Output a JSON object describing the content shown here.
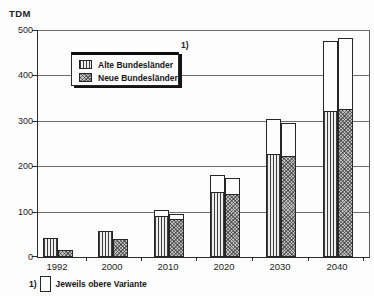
{
  "colors": {
    "ink": "#222222",
    "paper": "#fcfcfc",
    "crosshatch_gray": "#c2c2c2"
  },
  "legend": {
    "marker_note": "1)",
    "items": [
      {
        "label": "Alte Bundesländer",
        "pattern": "vertical-stripes"
      },
      {
        "label": "Neue Bundesländer",
        "pattern": "crosshatch"
      }
    ]
  },
  "footnote": {
    "marker": "1)",
    "text": "Jeweils obere Variante"
  },
  "chart_data": {
    "type": "bar",
    "title": "",
    "ylabel": "TDM",
    "xlabel": "",
    "ylim": [
      0,
      500
    ],
    "y_ticks": [
      0,
      100,
      200,
      300,
      400,
      500
    ],
    "grid": true,
    "legend_position": "top-left",
    "categories": [
      "1992",
      "2000",
      "2010",
      "2020",
      "2030",
      "2040"
    ],
    "series": [
      {
        "name": "Alte Bundesländer",
        "pattern": "vertical-stripes",
        "values": [
          43,
          57,
          90,
          143,
          228,
          322
        ],
        "upper_variant": [
          43,
          57,
          103,
          180,
          305,
          476
        ]
      },
      {
        "name": "Neue Bundesländer",
        "pattern": "crosshatch",
        "values": [
          15,
          40,
          83,
          139,
          222,
          327
        ],
        "upper_variant": [
          15,
          40,
          95,
          175,
          296,
          483
        ]
      }
    ],
    "annotation": "White bar tops mark the upper variant (1) Jeweils obere Variante)"
  }
}
